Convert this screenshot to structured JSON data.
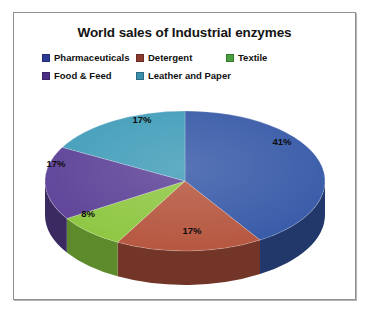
{
  "chart": {
    "title": "World sales of Industrial enzymes",
    "frame_border_color": "#8f8f8f",
    "background": "#ffffff"
  },
  "legend": {
    "rows": [
      [
        {
          "label": "Pharmaceuticals",
          "color": "#2c3c94"
        },
        {
          "label": "Detergent",
          "color": "#8c3a2e"
        },
        {
          "label": "Textile",
          "color": "#4aa03f"
        }
      ],
      [
        {
          "label": "Food & Feed",
          "color": "#4b2f86"
        },
        {
          "label": "Leather and Paper",
          "color": "#3b8fae"
        }
      ]
    ]
  },
  "chart_data": {
    "type": "pie",
    "title": "World sales of Industrial enzymes",
    "categories": [
      "Pharmaceuticals",
      "Detergent",
      "Textile",
      "Food & Feed",
      "Leather and Paper"
    ],
    "values": [
      41,
      17,
      8,
      17,
      17
    ],
    "value_labels": [
      "41%",
      "17%",
      "8%",
      "17%",
      "17%"
    ],
    "unit": "percent",
    "colors": [
      "#3457a6",
      "#b5543c",
      "#8cc63f",
      "#5b3f96",
      "#3f9cb8"
    ],
    "side_colors": [
      "#22386b",
      "#723527",
      "#5d8a2a",
      "#3b2a61",
      "#2a697c"
    ],
    "legend_position": "top",
    "three_d": true,
    "start_angle_deg": 0,
    "direction": "clockwise",
    "labels_inside": true
  },
  "slice_labels": [
    {
      "text": "41%",
      "x": 268,
      "y": 58
    },
    {
      "text": "17%",
      "x": 178,
      "y": 147
    },
    {
      "text": "8%",
      "x": 74,
      "y": 130
    },
    {
      "text": "17%",
      "x": 42,
      "y": 80
    },
    {
      "text": "17%",
      "x": 128,
      "y": 36
    }
  ]
}
